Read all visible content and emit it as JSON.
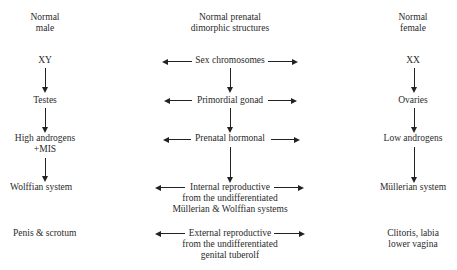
{
  "headers": {
    "male": [
      "Normal",
      "male"
    ],
    "center": [
      "Normal prenatal",
      "dimorphic structures"
    ],
    "female": [
      "Normal",
      "female"
    ]
  },
  "rows": [
    {
      "male": [
        "XY"
      ],
      "center": [
        "Sex chromosomes"
      ],
      "female": [
        "XX"
      ]
    },
    {
      "male": [
        "Testes"
      ],
      "center": [
        "Primordial gonad"
      ],
      "female": [
        "Ovaries"
      ]
    },
    {
      "male": [
        "High androgens",
        "+MIS"
      ],
      "center": [
        "Prenatal hormonal"
      ],
      "female": [
        "Low androgens"
      ]
    },
    {
      "male": [
        "Wolffian system"
      ],
      "center": [
        "Internal reproductive",
        "from the undifferentiated",
        "Müllerian & Wolffian systems"
      ],
      "female": [
        "Müllerian system"
      ]
    },
    {
      "male": [
        "Penis & scrotum"
      ],
      "center": [
        "External reproductive",
        "from the undifferentiated",
        "genital tuberolf"
      ],
      "female": [
        "Clitoris, labia",
        "lower vagina"
      ]
    }
  ],
  "colors": {
    "ink": "#222222",
    "text": "#2a2a2a",
    "background": "#ffffff"
  }
}
